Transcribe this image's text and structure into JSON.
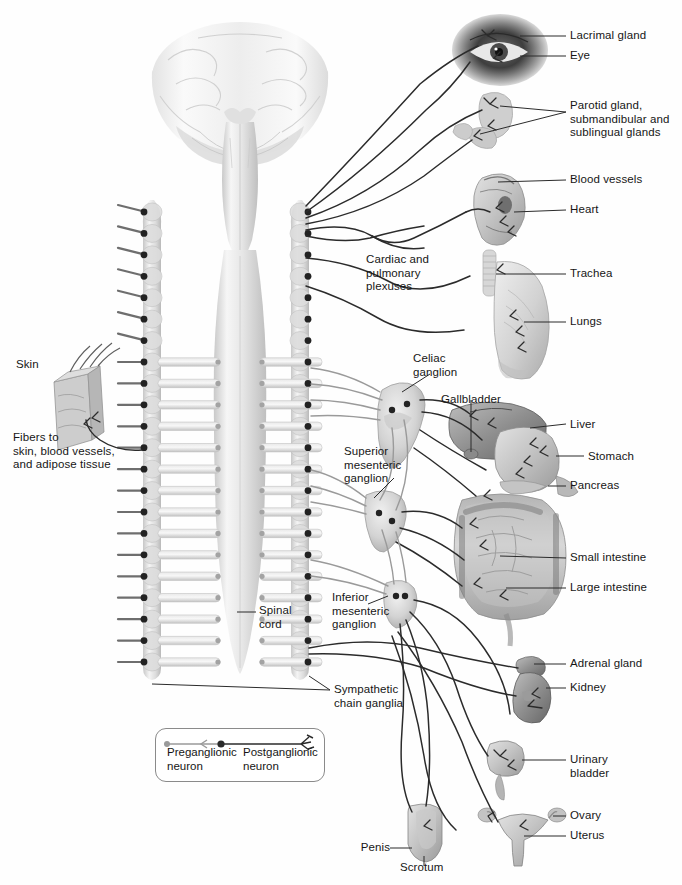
{
  "figure": {
    "background_color": "#fefefe",
    "line_color": "#2b2b2b",
    "text_color": "#161616"
  },
  "labels": {
    "lacrimal_gland": "Lacrimal gland",
    "eye": "Eye",
    "salivary_glands": "Parotid gland,\nsubmandibular and\nsublingual glands",
    "blood_vessels": "Blood vessels",
    "heart": "Heart",
    "trachea": "Trachea",
    "lungs": "Lungs",
    "cardiac_pulmonary_plexuses": "Cardiac and\npulmonary\nplexuses",
    "celiac_ganglion": "Celiac\nganglion",
    "gallbladder": "Gallbladder",
    "liver": "Liver",
    "stomach": "Stomach",
    "pancreas": "Pancreas",
    "superior_mesenteric_ganglion": "Superior\nmesenteric\nganglion",
    "small_intestine": "Small intestine",
    "large_intestine": "Large intestine",
    "inferior_mesenteric_ganglion": "Inferior\nmesenteric\nganglion",
    "adrenal_gland": "Adrenal gland",
    "kidney": "Kidney",
    "urinary_bladder": "Urinary\nbladder",
    "ovary": "Ovary",
    "uterus": "Uterus",
    "penis": "Penis",
    "scrotum": "Scrotum",
    "skin": "Skin",
    "fibers_to": "Fibers to\nskin, blood vessels,\nand adipose tissue",
    "spinal_cord": "Spinal\ncord",
    "sympathetic_chain_ganglia": "Sympathetic\nchain ganglia"
  },
  "legend": {
    "preganglionic": "Preganglionic\nneuron",
    "postganglionic": "Postganglionic\nneuron",
    "preganglionic_color": "#9a9a9a",
    "postganglionic_color": "#2b2b2b"
  },
  "structures": {
    "brain": "brain-cerebrum-and-brainstem",
    "spinal_cord": "spinal-cord-tapering",
    "chain_left": "sympathetic-chain-left",
    "chain_right": "sympathetic-chain-right",
    "segments": 22
  }
}
